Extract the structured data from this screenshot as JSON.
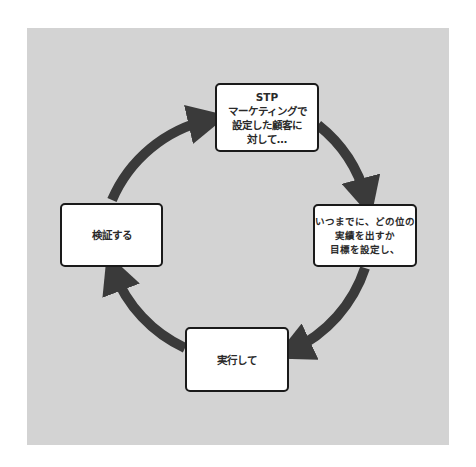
{
  "diagram": {
    "type": "cycle",
    "colors": {
      "panel": "#d3d3d3",
      "arrow": "#3a3a3a",
      "box_border": "#1a1a1a",
      "box_fill": "#ffffff"
    },
    "steps": [
      {
        "position": "top",
        "lines": [
          "STP",
          "マーケティングで",
          "設定した顧客に",
          "対して…"
        ]
      },
      {
        "position": "right",
        "lines": [
          "いつまでに、どの位の",
          "実績を出すか",
          "目標を設定し、"
        ]
      },
      {
        "position": "bottom",
        "lines": [
          "実行して"
        ]
      },
      {
        "position": "left",
        "lines": [
          "検証する"
        ]
      }
    ],
    "flow": "clockwise"
  }
}
